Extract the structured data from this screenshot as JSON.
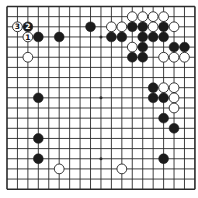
{
  "diagram": {
    "type": "go-board",
    "size": 19,
    "colors": {
      "background": "#ffffff",
      "line": "#2a2a2a",
      "black_stone": "#1c1c1c",
      "white_stone": "#ffffff",
      "stone_outline": "#222222"
    },
    "star_points": [
      [
        3,
        3
      ],
      [
        9,
        3
      ],
      [
        15,
        3
      ],
      [
        3,
        9
      ],
      [
        9,
        9
      ],
      [
        15,
        9
      ],
      [
        3,
        15
      ],
      [
        9,
        15
      ],
      [
        15,
        15
      ]
    ],
    "stones": [
      {
        "col": 8,
        "row": 2,
        "color": "black"
      },
      {
        "col": 3,
        "row": 3,
        "color": "black"
      },
      {
        "col": 5,
        "row": 3,
        "color": "black"
      },
      {
        "col": 2,
        "row": 5,
        "color": "white"
      },
      {
        "col": 1,
        "row": 2,
        "color": "white",
        "label": "3"
      },
      {
        "col": 2,
        "row": 2,
        "color": "black",
        "label": "2"
      },
      {
        "col": 2,
        "row": 3,
        "color": "white",
        "label": "1"
      },
      {
        "col": 12,
        "row": 1,
        "color": "white"
      },
      {
        "col": 13,
        "row": 1,
        "color": "white"
      },
      {
        "col": 14,
        "row": 1,
        "color": "white"
      },
      {
        "col": 15,
        "row": 1,
        "color": "white"
      },
      {
        "col": 10,
        "row": 2,
        "color": "white"
      },
      {
        "col": 11,
        "row": 2,
        "color": "white"
      },
      {
        "col": 12,
        "row": 2,
        "color": "black"
      },
      {
        "col": 13,
        "row": 2,
        "color": "black"
      },
      {
        "col": 14,
        "row": 2,
        "color": "white"
      },
      {
        "col": 15,
        "row": 2,
        "color": "black"
      },
      {
        "col": 16,
        "row": 2,
        "color": "white"
      },
      {
        "col": 10,
        "row": 3,
        "color": "black"
      },
      {
        "col": 11,
        "row": 3,
        "color": "black"
      },
      {
        "col": 13,
        "row": 3,
        "color": "black"
      },
      {
        "col": 14,
        "row": 3,
        "color": "black"
      },
      {
        "col": 15,
        "row": 3,
        "color": "black"
      },
      {
        "col": 12,
        "row": 4,
        "color": "white"
      },
      {
        "col": 13,
        "row": 4,
        "color": "black"
      },
      {
        "col": 16,
        "row": 4,
        "color": "black"
      },
      {
        "col": 17,
        "row": 4,
        "color": "black"
      },
      {
        "col": 12,
        "row": 5,
        "color": "black"
      },
      {
        "col": 13,
        "row": 5,
        "color": "black"
      },
      {
        "col": 15,
        "row": 5,
        "color": "white"
      },
      {
        "col": 16,
        "row": 5,
        "color": "white"
      },
      {
        "col": 17,
        "row": 5,
        "color": "white"
      },
      {
        "col": 14,
        "row": 8,
        "color": "black"
      },
      {
        "col": 15,
        "row": 8,
        "color": "white"
      },
      {
        "col": 16,
        "row": 8,
        "color": "white"
      },
      {
        "col": 14,
        "row": 9,
        "color": "black"
      },
      {
        "col": 15,
        "row": 9,
        "color": "black"
      },
      {
        "col": 16,
        "row": 9,
        "color": "white"
      },
      {
        "col": 16,
        "row": 10,
        "color": "white"
      },
      {
        "col": 15,
        "row": 11,
        "color": "black"
      },
      {
        "col": 16,
        "row": 12,
        "color": "black"
      },
      {
        "col": 3,
        "row": 9,
        "color": "black"
      },
      {
        "col": 3,
        "row": 13,
        "color": "black"
      },
      {
        "col": 3,
        "row": 15,
        "color": "black"
      },
      {
        "col": 5,
        "row": 16,
        "color": "white"
      },
      {
        "col": 15,
        "row": 15,
        "color": "black"
      },
      {
        "col": 11,
        "row": 16,
        "color": "white"
      }
    ]
  }
}
